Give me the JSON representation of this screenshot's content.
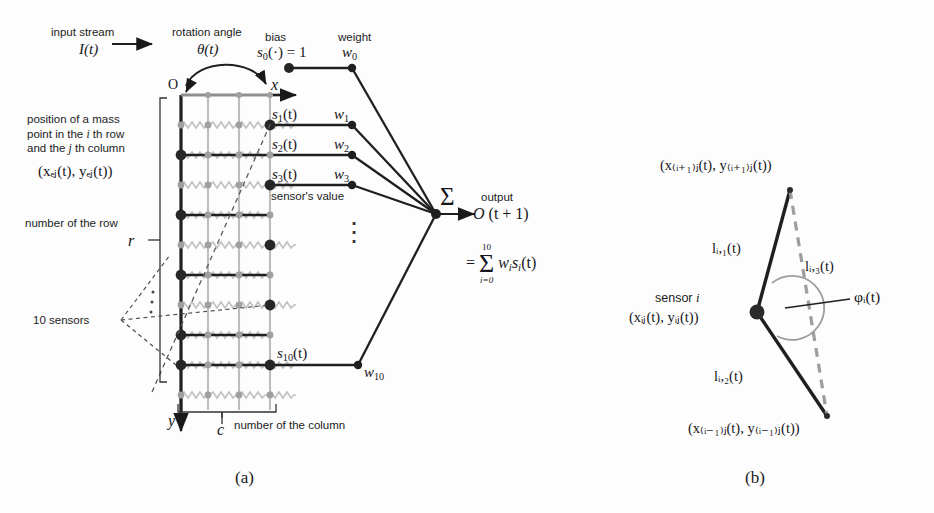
{
  "figure": {
    "panel_a_caption": "(a)",
    "panel_b_caption": "(b)"
  },
  "panel_a": {
    "input_stream_label": "input stream",
    "input_stream_symbol": "I(t)",
    "rotation_angle_label": "rotation angle",
    "rotation_angle_symbol": "θ(t)",
    "bias_label": "bias",
    "bias_symbol_base": "s",
    "bias_symbol_sub": "0",
    "bias_symbol_rest": "(·) = 1",
    "weight_label": "weight",
    "weight0_base": "w",
    "weight0_sub": "0",
    "origin_label": "O",
    "axis_x_label": "x",
    "axis_y_label": "y",
    "mass_point_text_line1": "position of a mass",
    "mass_point_text_line2_a": "point in the ",
    "mass_point_text_line2_i": "i",
    "mass_point_text_line2_b": " th row",
    "mass_point_text_line3_a": "and the ",
    "mass_point_text_line3_j": "j",
    "mass_point_text_line3_b": " th column",
    "mass_point_coords": "(xₑⱼ(t), yₑⱼ(t))",
    "row_count_label": "number of the row",
    "row_count_symbol": "r",
    "column_count_label": "number of the column",
    "column_count_symbol": "c",
    "sensors_label": "10 sensors",
    "sensor_value_label": "sensor's value",
    "vertical_ellipsis": "⋮",
    "sensors": [
      {
        "name": "s",
        "sub": "1",
        "weight": "w",
        "weight_sub": "1"
      },
      {
        "name": "s",
        "sub": "2",
        "weight": "w",
        "weight_sub": "2"
      },
      {
        "name": "s",
        "sub": "3",
        "weight": "w",
        "weight_sub": "3"
      },
      {
        "name": "s",
        "sub": "10",
        "weight": "w",
        "weight_sub": "10"
      }
    ],
    "sum_symbol": "Σ",
    "output_label": "output",
    "output_symbol": "O (t + 1)",
    "formula_eq": "=",
    "formula_sum": "Σ",
    "formula_upper": "10",
    "formula_lower": "i=0",
    "formula_body_w": "w",
    "formula_body_wsub": "i",
    "formula_body_s": "s",
    "formula_body_ssub": "i",
    "formula_body_t": "(t)"
  },
  "panel_b": {
    "sensor_label_text": "sensor ",
    "sensor_label_index": "i",
    "sensor_coords": "(xᵢⱼ(t), yᵢⱼ(t))",
    "top_coords": "(x₍ᵢ₊₁₎ⱼ(t), y₍ᵢ₊₁₎ⱼ(t))",
    "bottom_coords": "(x₍ᵢ₋₁₎ⱼ(t), y₍ᵢ₋₁₎ⱼ(t))",
    "l1_label": "lᵢ,₁(t)",
    "l2_label": "lᵢ,₂(t)",
    "l3_label": "lᵢ,₃(t)",
    "phi_label": "φᵢ(t)"
  },
  "colors": {
    "ink": "#1a1a1a",
    "grid_gray": "#b8b8b8",
    "spring_gray": "#c0c0c0",
    "node_dark": "#262626",
    "node_gray": "#9a9a9a",
    "dashed": "#555555",
    "arc_gray": "#9d9d9d"
  }
}
